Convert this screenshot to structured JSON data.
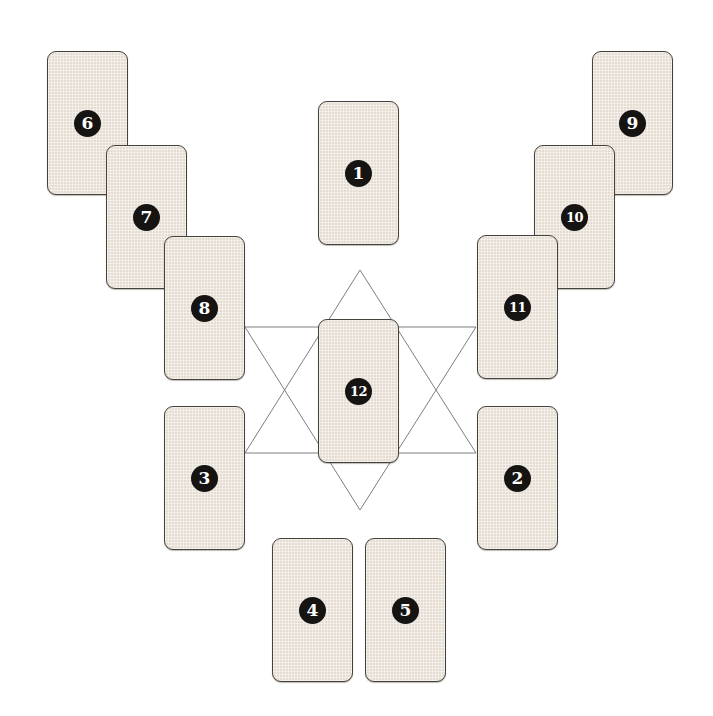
{
  "colors": {
    "background": "#ffffff",
    "card-fill": "#ece4d8",
    "card-border": "#45413b",
    "badge-bg": "#161412",
    "badge-text": "#ffffff",
    "star-line": "#7e7e7e"
  },
  "card_size": {
    "width": 81,
    "height": 144
  },
  "cards": [
    {
      "label": "6",
      "x": 47,
      "y": 51
    },
    {
      "label": "7",
      "x": 106,
      "y": 145
    },
    {
      "label": "8",
      "x": 164,
      "y": 236
    },
    {
      "label": "9",
      "x": 592,
      "y": 51
    },
    {
      "label": "10",
      "x": 534,
      "y": 145
    },
    {
      "label": "11",
      "x": 477,
      "y": 235
    },
    {
      "label": "1",
      "x": 318,
      "y": 101
    },
    {
      "label": "12",
      "x": 318,
      "y": 319
    },
    {
      "label": "3",
      "x": 164,
      "y": 406
    },
    {
      "label": "2",
      "x": 477,
      "y": 406
    },
    {
      "label": "4",
      "x": 272,
      "y": 538
    },
    {
      "label": "5",
      "x": 365,
      "y": 538
    }
  ],
  "star": {
    "upward_triangle_points": "360,270 245,453 476,453",
    "downward_triangle_points": "245,327 476,327 360,510"
  }
}
